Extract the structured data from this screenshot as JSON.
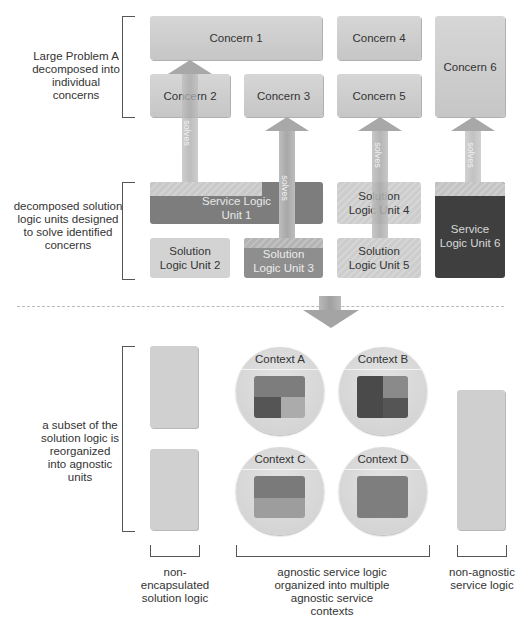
{
  "sections": {
    "top_label": "Large Problem A decomposed into individual concerns",
    "middle_label": "decomposed solution logic units designed to solve identified concerns",
    "bottom_label": "a subset of the solution logic is reorganized into agnostic units"
  },
  "concerns": [
    {
      "id": 1,
      "label": "Concern 1"
    },
    {
      "id": 2,
      "label": "Concern 2"
    },
    {
      "id": 3,
      "label": "Concern 3"
    },
    {
      "id": 4,
      "label": "Concern 4"
    },
    {
      "id": 5,
      "label": "Concern 5"
    },
    {
      "id": 6,
      "label": "Concern 6"
    }
  ],
  "units": [
    {
      "id": 1,
      "label": "Service Logic Unit 1",
      "type": "service"
    },
    {
      "id": 2,
      "label": "Solution Logic Unit 2",
      "type": "solution"
    },
    {
      "id": 3,
      "label": "Solution Logic Unit 3",
      "type": "service"
    },
    {
      "id": 4,
      "label": "Solution Logic Unit 4",
      "type": "solution"
    },
    {
      "id": 5,
      "label": "Solution Logic Unit 5",
      "type": "solution"
    },
    {
      "id": 6,
      "label": "Service Logic Unit 6",
      "type": "service-dark"
    }
  ],
  "arrows": {
    "label": "solves"
  },
  "contexts": [
    {
      "id": "A",
      "label": "Context A"
    },
    {
      "id": "B",
      "label": "Context B"
    },
    {
      "id": "C",
      "label": "Context C"
    },
    {
      "id": "D",
      "label": "Context D"
    }
  ],
  "bottom_captions": {
    "non_encapsulated": "non-encapsulated solution logic",
    "agnostic": "agnostic service logic organized into multiple agnostic service contexts",
    "non_agnostic": "non-agnostic service logic"
  },
  "colors": {
    "concern": "#cfcfcf",
    "solution_unit": "#cdcdcd",
    "service_unit": "#7d7d7d",
    "service_unit_dark": "#3f3f3f",
    "arrow": "#a8a8a8"
  }
}
